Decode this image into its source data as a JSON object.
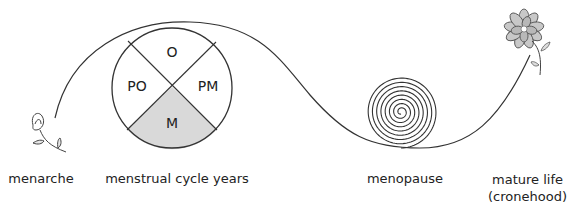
{
  "diagram": {
    "stages": [
      {
        "id": "menarche",
        "label": "menarche",
        "icon": "bud-icon"
      },
      {
        "id": "cycle",
        "label": "menstrual cycle years",
        "icon": "cycle-wheel"
      },
      {
        "id": "menopause",
        "label": "menopause",
        "icon": "spiral-icon"
      },
      {
        "id": "mature",
        "label_line1": "mature life",
        "label_line2": "(cronehood)",
        "icon": "flower-icon"
      }
    ],
    "cycle_wheel": {
      "segments": [
        {
          "id": "O",
          "label": "O",
          "position": "top",
          "fill": "#ffffff"
        },
        {
          "id": "PM",
          "label": "PM",
          "position": "right",
          "fill": "#ffffff"
        },
        {
          "id": "M",
          "label": "M",
          "position": "bottom",
          "fill": "#d9d9d9"
        },
        {
          "id": "PO",
          "label": "PO",
          "position": "left",
          "fill": "#ffffff"
        }
      ]
    },
    "colors": {
      "line": "#333333",
      "shaded_segment": "#d9d9d9",
      "flower_fill": "#c8c8c8"
    }
  }
}
